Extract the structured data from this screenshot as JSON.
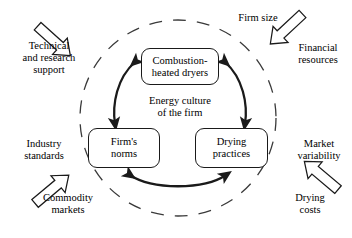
{
  "diagram": {
    "title": "Energy culture of the firm",
    "center_label": "Energy culture\nof the firm",
    "colors": {
      "stroke": "#1a1a1a",
      "text": "#000000",
      "background": "#ffffff",
      "dashed_circle": "#3a3a3a"
    },
    "core_nodes": [
      {
        "id": "combustion-heated-dryers",
        "label": "Combustion-\nheated dryers"
      },
      {
        "id": "firms-norms",
        "label": "Firm's\nnorms"
      },
      {
        "id": "drying-practices",
        "label": "Drying\npractices"
      }
    ],
    "core_links": [
      {
        "id": "dryers-norms",
        "from": "combustion-heated-dryers",
        "to": "firms-norms",
        "style": "curved",
        "arrowheads": "both"
      },
      {
        "id": "dryers-practices",
        "from": "combustion-heated-dryers",
        "to": "drying-practices",
        "style": "curved",
        "arrowheads": "both"
      },
      {
        "id": "norms-practices",
        "from": "firms-norms",
        "to": "drying-practices",
        "style": "curved",
        "arrowheads": "both"
      }
    ],
    "boundary": {
      "shape": "circle",
      "style": "dashed"
    },
    "external_factors": [
      {
        "id": "technical-and-research-support",
        "label": "Technical\nand research\nsupport",
        "position": "top-left"
      },
      {
        "id": "firm-size",
        "label": "Firm size",
        "position": "top-right"
      },
      {
        "id": "financial-resources",
        "label": "Financial\nresources",
        "position": "right-top"
      },
      {
        "id": "industry-standards",
        "label": "Industry\nstandards",
        "position": "left-middle"
      },
      {
        "id": "commodity-markets",
        "label": "Commodity\nmarkets",
        "position": "bottom-left"
      },
      {
        "id": "market-variability",
        "label": "Market\nvariability",
        "position": "right-middle"
      },
      {
        "id": "drying-costs",
        "label": "Drying\ncosts",
        "position": "bottom-right"
      }
    ],
    "inward_block_arrows": [
      {
        "id": "block-arrow-top-left",
        "points_to": "center",
        "direction": "down-right"
      },
      {
        "id": "block-arrow-top-right",
        "points_to": "center",
        "direction": "down-left"
      },
      {
        "id": "block-arrow-bottom-left",
        "points_to": "center",
        "direction": "up-right"
      },
      {
        "id": "block-arrow-bottom-right",
        "points_to": "center",
        "direction": "up-left"
      }
    ]
  }
}
